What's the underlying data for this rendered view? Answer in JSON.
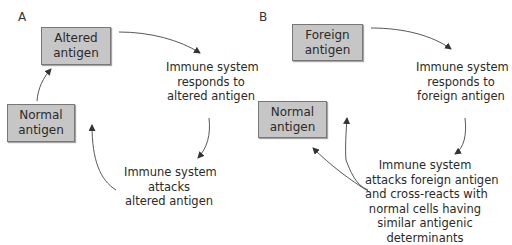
{
  "panels": [
    {
      "label": "A",
      "boxes": {
        "top": [
          "Altered",
          "antigen"
        ],
        "left": [
          "Normal",
          "antigen"
        ]
      },
      "responds": [
        "Immune system",
        "responds to",
        "altered antigen"
      ],
      "attacks": [
        "Immune system",
        "attacks",
        "altered antigen"
      ]
    },
    {
      "label": "B",
      "boxes": {
        "top": [
          "Foreign",
          "antigen"
        ],
        "left": [
          "Normal",
          "antigen"
        ]
      },
      "responds": [
        "Immune system",
        "responds to",
        "foreign antigen"
      ],
      "attacks": [
        "Immune system",
        "attacks foreign antigen",
        "and cross-reacts with",
        "normal cells having",
        "similar antigenic",
        "determinants"
      ]
    }
  ],
  "colors": {
    "box_fill": "#c6c6c6",
    "arrow": "#333333"
  }
}
